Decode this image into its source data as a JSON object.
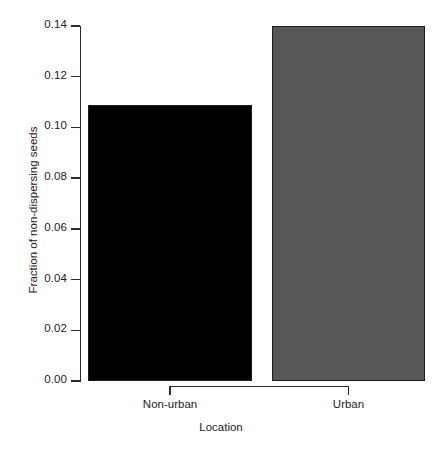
{
  "chart_data": {
    "type": "bar",
    "title": "",
    "xlabel": "Location",
    "ylabel": "Fraction of non-dispersing seeds",
    "categories": [
      "Non-urban",
      "Urban"
    ],
    "values": [
      0.109,
      0.14
    ],
    "series": [
      {
        "name": "Fraction of non-dispersing seeds",
        "values": [
          0.109,
          0.14
        ]
      }
    ],
    "bar_colors": [
      "#000000",
      "#575757"
    ],
    "bar_border_color": "#1d1d1d",
    "ylim": [
      0.0,
      0.14
    ],
    "xlim_note": "categorical",
    "y_ticks": [
      0.0,
      0.02,
      0.04,
      0.06,
      0.08,
      0.1,
      0.12,
      0.14
    ],
    "y_tick_labels": [
      "0.00",
      "0.02",
      "0.04",
      "0.06",
      "0.08",
      "0.10",
      "0.12",
      "0.14"
    ],
    "grid": false,
    "legend": false,
    "legend_position": "none",
    "annotations": []
  },
  "axes": {
    "y": {
      "title": "Fraction of non-dispersing seeds",
      "ticks": [
        {
          "label": "0.14",
          "value": 0.14
        },
        {
          "label": "0.12",
          "value": 0.12
        },
        {
          "label": "0.10",
          "value": 0.1
        },
        {
          "label": "0.08",
          "value": 0.08
        },
        {
          "label": "0.06",
          "value": 0.06
        },
        {
          "label": "0.04",
          "value": 0.04
        },
        {
          "label": "0.02",
          "value": 0.02
        },
        {
          "label": "0.00",
          "value": 0.0
        }
      ]
    },
    "x": {
      "title": "Location",
      "ticks": [
        {
          "label": "Non-urban"
        },
        {
          "label": "Urban"
        }
      ]
    }
  },
  "bars": [
    {
      "label": "Non-urban",
      "value": 0.109,
      "color": "#000000"
    },
    {
      "label": "Urban",
      "value": 0.14,
      "color": "#575757"
    }
  ]
}
